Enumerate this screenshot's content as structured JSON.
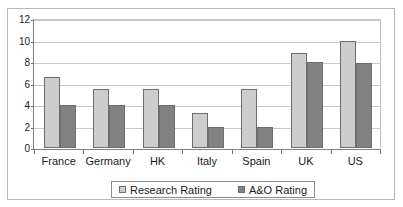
{
  "chart_data": {
    "type": "bar",
    "title": "",
    "xlabel": "",
    "ylabel": "",
    "ylim": [
      0,
      12
    ],
    "ytick_values": [
      0,
      2,
      4,
      6,
      8,
      10,
      12
    ],
    "ytick_labels": [
      "0",
      "2",
      "4",
      "6",
      "8",
      "10",
      "12"
    ],
    "grid": true,
    "legend_position": "bottom",
    "categories": [
      "France",
      "Germany",
      "HK",
      "Italy",
      "Spain",
      "UK",
      "US"
    ],
    "series": [
      {
        "name": "Research Rating",
        "color": "#cdcdcd",
        "values": [
          6.6,
          5.5,
          5.5,
          3.3,
          5.5,
          8.8,
          10.0
        ]
      },
      {
        "name": "A&O Rating",
        "color": "#828282",
        "values": [
          4.0,
          4.0,
          4.0,
          2.0,
          2.0,
          8.0,
          7.9
        ]
      }
    ]
  },
  "legend": {
    "items": [
      {
        "label": "Research Rating",
        "swatch": "research"
      },
      {
        "label": "A&O Rating",
        "swatch": "ao"
      }
    ]
  },
  "colors": {
    "research_bar": "#cdcdcd",
    "ao_bar": "#828282",
    "gridline": "#c9c9c9",
    "axis": "#808080",
    "frame": "#b9b9b9",
    "text": "#1a1a1a"
  }
}
